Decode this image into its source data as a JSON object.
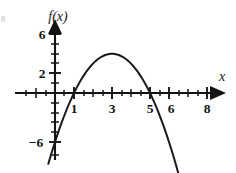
{
  "figure": {
    "width": 236,
    "height": 173,
    "background": "#ffffff",
    "ink_color": "#141414"
  },
  "axes": {
    "x_axis_label": "x",
    "y_axis_label": "f(x)",
    "origin_px": {
      "x": 55,
      "y": 93
    },
    "x_unit_px": 19.0,
    "y_unit_px": 9.8,
    "x_arrow": true,
    "y_arrow": true
  },
  "chart_data": {
    "type": "line",
    "title": "",
    "subtitle": "",
    "xlabel": "x",
    "ylabel": "f(x)",
    "grid": false,
    "legend": null,
    "xlim": [
      -1,
      9.2
    ],
    "ylim": [
      -9,
      8
    ],
    "x_ticks_labeled": [
      1,
      3,
      5,
      6,
      8
    ],
    "x_tick_labels": [
      "1",
      "3",
      "5",
      "6",
      "8"
    ],
    "x_ticks_all": [
      -1,
      0,
      1,
      2,
      3,
      4,
      5,
      6,
      7,
      8
    ],
    "y_ticks_labeled": [
      6,
      2,
      -6
    ],
    "y_tick_labels": [
      "6",
      "2",
      "−6"
    ],
    "y_ticks_all": [
      -8,
      -6,
      -4,
      -2,
      2,
      4,
      6
    ],
    "series": [
      {
        "name": "f(x)",
        "kind": "parabola",
        "equation": "f(x) = -(x-1)(x-5) = -x^2 + 6x - 5",
        "orientation": "opens-downward",
        "vertex": {
          "x": 3,
          "y": 4
        },
        "roots": [
          1,
          5
        ],
        "y_intercept": -5,
        "x": [
          -0.3,
          0,
          0.5,
          1,
          1.5,
          2,
          2.5,
          3,
          3.5,
          4,
          4.5,
          5,
          5.5,
          6,
          6.5,
          7,
          7.3
        ],
        "values": [
          -6.9,
          -5,
          -2.75,
          0,
          1.75,
          3,
          3.75,
          4,
          3.75,
          3,
          1.75,
          0,
          -2.75,
          -5,
          -6.75,
          -8,
          -9.0
        ]
      }
    ]
  }
}
